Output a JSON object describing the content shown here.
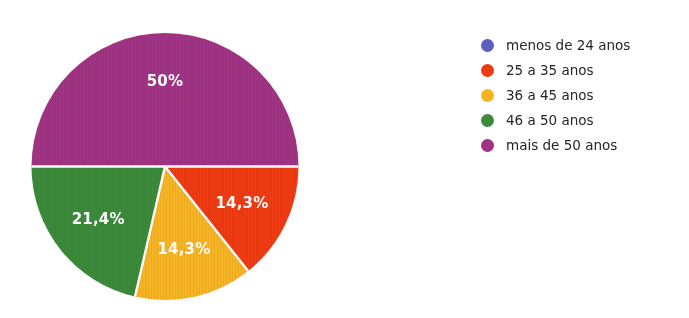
{
  "chart_data": {
    "type": "pie",
    "title": "",
    "subtitle": "",
    "xlabel": "",
    "ylabel": "",
    "grid": false,
    "legend_position": "right",
    "start_angle_deg": 0,
    "direction": "clockwise",
    "categories": [
      "menos de 24 anos",
      "25 a 35 anos",
      "36 a 45 anos",
      "46 a 50 anos",
      "mais de 50 anos"
    ],
    "values": [
      0,
      14.3,
      14.3,
      21.4,
      50
    ],
    "value_labels": [
      "",
      "14,3%",
      "14,3%",
      "21,4%",
      "50%"
    ],
    "colors": [
      "#5a5ebd",
      "#f03a12",
      "#f6b322",
      "#3a8a3a",
      "#a03383"
    ],
    "slices": [
      {
        "label": "menos de 24 anos",
        "value": 0,
        "display": "",
        "color": "#5a5ebd",
        "visible_in_pie": false
      },
      {
        "label": "25 a 35 anos",
        "value": 14.3,
        "display": "14,3%",
        "color": "#f03a12",
        "visible_in_pie": true
      },
      {
        "label": "36 a 45 anos",
        "value": 14.3,
        "display": "14,3%",
        "color": "#f6b322",
        "visible_in_pie": true
      },
      {
        "label": "46 a 50 anos",
        "value": 21.4,
        "display": "21,4%",
        "color": "#3a8a3a",
        "visible_in_pie": true
      },
      {
        "label": "mais de 50 anos",
        "value": 50,
        "display": "50%",
        "color": "#a03383",
        "visible_in_pie": true
      }
    ]
  },
  "pie": {
    "label_red": "14,3%",
    "label_yellow": "14,3%",
    "label_green": "21,4%",
    "label_purple": "50%"
  },
  "legend": {
    "items": [
      {
        "label": "menos de 24 anos",
        "color": "#5a5ebd"
      },
      {
        "label": "25 a 35 anos",
        "color": "#f03a12"
      },
      {
        "label": "36 a 45 anos",
        "color": "#f6b322"
      },
      {
        "label": "46 a 50 anos",
        "color": "#3a8a3a"
      },
      {
        "label": "mais de 50 anos",
        "color": "#a03383"
      }
    ]
  },
  "colors": {
    "background": "#ffffff",
    "label_text": "#ffffff",
    "legend_text": "#262626",
    "slice_separator": "#ffffff"
  }
}
